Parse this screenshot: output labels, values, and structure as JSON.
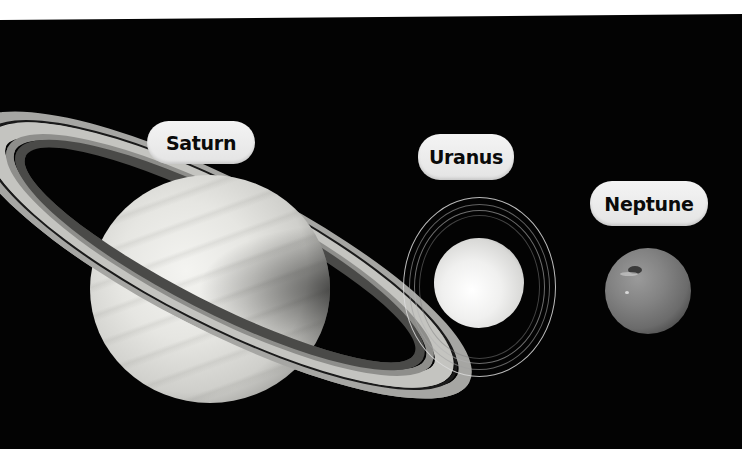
{
  "scene": {
    "description": "Outer planets size comparison",
    "background_color": "#030303",
    "top_strip_color": "#ffffff"
  },
  "planets": [
    {
      "name": "Saturn",
      "label": "Saturn",
      "has_rings": true
    },
    {
      "name": "Uranus",
      "label": "Uranus",
      "has_rings": true
    },
    {
      "name": "Neptune",
      "label": "Neptune",
      "has_rings": false
    }
  ],
  "label_style": {
    "pill_color": "#ececec",
    "text_color": "#0a0a0a"
  }
}
